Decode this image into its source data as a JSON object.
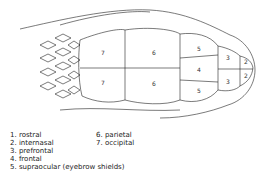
{
  "diagram": {
    "scale_numbers": {
      "occipital_top": "7",
      "occipital_bottom": "7",
      "parietal_top": "6",
      "parietal_bottom": "6",
      "supraocular_top": "5",
      "supraocular_bottom": "5",
      "frontal": "4",
      "prefrontal_top": "3",
      "prefrontal_bottom": "3",
      "internasal_top": "2",
      "internasal_bottom": "2"
    }
  },
  "legend": {
    "left": [
      "1. rostral",
      "2. internasal",
      "3. prefrontal",
      "4. frontal",
      "5. supraocular (eyebrow shields)"
    ],
    "right": [
      "6. parietal",
      "7. occipital"
    ]
  }
}
